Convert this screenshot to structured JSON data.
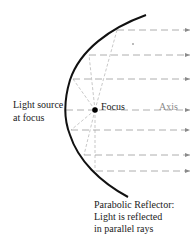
{
  "diagram": {
    "title": "Parabolic Reflector",
    "labels": {
      "light_source_line1": "Light source",
      "light_source_line2": "at focus",
      "focus": "Focus",
      "axis": "Axis",
      "caption_line1": "Parabolic Reflector:",
      "caption_line2": "Light is reflected",
      "caption_line3": "in parallel rays"
    },
    "focus_point": {
      "x": 95,
      "y": 110
    },
    "reflection_points": [
      {
        "x": 117,
        "y": 30
      },
      {
        "x": 89,
        "y": 55
      },
      {
        "x": 73,
        "y": 79
      },
      {
        "x": 66,
        "y": 110
      },
      {
        "x": 71,
        "y": 130
      },
      {
        "x": 84,
        "y": 155
      },
      {
        "x": 96,
        "y": 171
      }
    ],
    "colors": {
      "reflector": "#111111",
      "rays": "#9a9a9a",
      "text": "#222222",
      "axis_label": "#8a8a8a"
    }
  }
}
